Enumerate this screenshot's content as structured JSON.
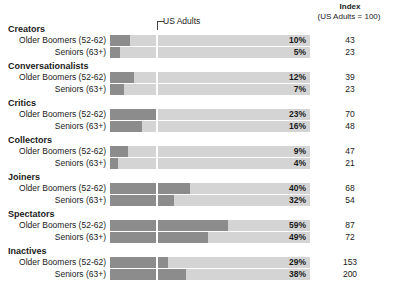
{
  "header": {
    "index_title": "Index",
    "index_subtitle": "(US Adults = 100)",
    "reference_label": "US Adults"
  },
  "chart_data": {
    "type": "bar",
    "title": "",
    "xlabel": "",
    "ylabel": "",
    "xlim": [
      0,
      100
    ],
    "grid": false,
    "legend": "none",
    "reference_line": {
      "label": "US Adults",
      "value": 23
    },
    "categories": [
      "Creators",
      "Conversationalists",
      "Critics",
      "Collectors",
      "Joiners",
      "Spectators",
      "Inactives"
    ],
    "series": [
      {
        "name": "Older Boomers (52-62)",
        "values": [
          10,
          12,
          23,
          9,
          40,
          59,
          29
        ],
        "index": [
          43,
          39,
          70,
          47,
          68,
          87,
          153
        ]
      },
      {
        "name": "Seniors (63+)",
        "values": [
          5,
          7,
          16,
          4,
          32,
          49,
          38
        ],
        "index": [
          23,
          23,
          48,
          21,
          54,
          72,
          200
        ]
      }
    ],
    "colors": {
      "fill": "#8c8c8c",
      "track": "#d4d4d4",
      "reference": "#ffffff"
    }
  },
  "groups": [
    {
      "title": "Creators",
      "rows": [
        {
          "label": "Older Boomers (52-62)",
          "pct": "10%",
          "value": 10,
          "index": "43"
        },
        {
          "label": "Seniors (63+)",
          "pct": "5%",
          "value": 5,
          "index": "23"
        }
      ]
    },
    {
      "title": "Conversationalists",
      "rows": [
        {
          "label": "Older Boomers (52-62)",
          "pct": "12%",
          "value": 12,
          "index": "39"
        },
        {
          "label": "Seniors (63+)",
          "pct": "7%",
          "value": 7,
          "index": "23"
        }
      ]
    },
    {
      "title": "Critics",
      "rows": [
        {
          "label": "Older Boomers (52-62)",
          "pct": "23%",
          "value": 23,
          "index": "70"
        },
        {
          "label": "Seniors (63+)",
          "pct": "16%",
          "value": 16,
          "index": "48"
        }
      ]
    },
    {
      "title": "Collectors",
      "rows": [
        {
          "label": "Older Boomers (52-62)",
          "pct": "9%",
          "value": 9,
          "index": "47"
        },
        {
          "label": "Seniors (63+)",
          "pct": "4%",
          "value": 4,
          "index": "21"
        }
      ]
    },
    {
      "title": "Joiners",
      "rows": [
        {
          "label": "Older Boomers (52-62)",
          "pct": "40%",
          "value": 40,
          "index": "68"
        },
        {
          "label": "Seniors (63+)",
          "pct": "32%",
          "value": 32,
          "index": "54"
        }
      ]
    },
    {
      "title": "Spectators",
      "rows": [
        {
          "label": "Older Boomers (52-62)",
          "pct": "59%",
          "value": 59,
          "index": "87"
        },
        {
          "label": "Seniors (63+)",
          "pct": "49%",
          "value": 49,
          "index": "72"
        }
      ]
    },
    {
      "title": "Inactives",
      "rows": [
        {
          "label": "Older Boomers (52-62)",
          "pct": "29%",
          "value": 29,
          "index": "153"
        },
        {
          "label": "Seniors (63+)",
          "pct": "38%",
          "value": 38,
          "index": "200"
        }
      ]
    }
  ]
}
